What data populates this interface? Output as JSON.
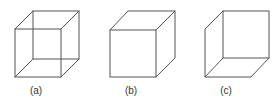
{
  "figure": {
    "stroke_color": "#555555",
    "label_color": "#333333",
    "cubes": [
      {
        "id": "a",
        "label": "(a)",
        "description": "wireframe cube, all 12 edges visible (Necker cube)",
        "label_pos": [
          36,
          94
        ]
      },
      {
        "id": "b",
        "label": "(b)",
        "description": "cube viewed from above-front, hidden edges removed",
        "label_pos": [
          131,
          94
        ]
      },
      {
        "id": "c",
        "label": "(c)",
        "description": "cube viewed from below, hidden edges removed",
        "label_pos": [
          226,
          94
        ]
      }
    ]
  }
}
